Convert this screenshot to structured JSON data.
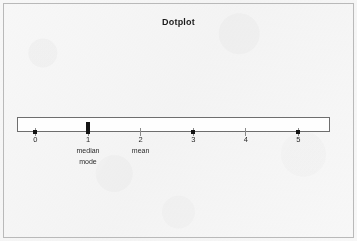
{
  "figure": {
    "title": "Dotplot",
    "background_color": "#f7f7f7",
    "frame_color": "#b9b9b9",
    "plot_box_border_color": "#6e6e6e",
    "plot_box_fill": "#fefefe",
    "dot_color": "#141414"
  },
  "chart_data": {
    "type": "scatter",
    "title": "Dotplot",
    "xlabel": "",
    "ylabel": "",
    "xlim": [
      -0.35,
      5.6
    ],
    "grid": false,
    "legend": null,
    "categories": [
      "0",
      "1",
      "2",
      "3",
      "4",
      "5"
    ],
    "values": [
      1,
      3,
      0,
      1,
      0,
      1
    ],
    "x_tick_labels": [
      "0",
      "1",
      "2",
      "3",
      "4",
      "5"
    ],
    "x_ticks": [
      0,
      1,
      2,
      3,
      4,
      5
    ],
    "points": [
      {
        "x": 0,
        "count": 1
      },
      {
        "x": 1,
        "count": 3
      },
      {
        "x": 2,
        "count": 0
      },
      {
        "x": 3,
        "count": 1
      },
      {
        "x": 4,
        "count": 0
      },
      {
        "x": 5,
        "count": 1
      }
    ],
    "annotations": [
      {
        "x": 1,
        "lines": [
          "median",
          "mode"
        ]
      },
      {
        "x": 2,
        "lines": [
          "mean"
        ]
      }
    ]
  },
  "axis": {
    "ticks": [
      {
        "label": "0",
        "dots": 1,
        "note_1": "",
        "note_2": ""
      },
      {
        "label": "1",
        "dots": 3,
        "note_1": "median",
        "note_2": "mode"
      },
      {
        "label": "2",
        "dots": 0,
        "note_1": "mean",
        "note_2": ""
      },
      {
        "label": "3",
        "dots": 1,
        "note_1": "",
        "note_2": ""
      },
      {
        "label": "4",
        "dots": 0,
        "note_1": "",
        "note_2": ""
      },
      {
        "label": "5",
        "dots": 1,
        "note_1": "",
        "note_2": ""
      }
    ]
  }
}
